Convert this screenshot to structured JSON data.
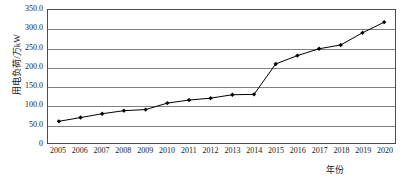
{
  "chart_data": {
    "type": "line",
    "title": "",
    "xlabel": "年份",
    "ylabel": "用电负荷/万kW",
    "categories": [
      "2005",
      "2006",
      "2007",
      "2008",
      "2009",
      "2010",
      "2011",
      "2012",
      "2013",
      "2014",
      "2015",
      "2016",
      "2017",
      "2018",
      "2019",
      "2020"
    ],
    "values": [
      57,
      67,
      77,
      85,
      88,
      105,
      113,
      118,
      127,
      128,
      208,
      230,
      248,
      258,
      290,
      318
    ],
    "series": [
      {
        "name": "用电负荷",
        "values": [
          57,
          67,
          77,
          85,
          88,
          105,
          113,
          118,
          127,
          128,
          208,
          230,
          248,
          258,
          290,
          318
        ]
      }
    ],
    "ylim": [
      0,
      350
    ],
    "ytick_labels": [
      "0",
      "50.0",
      "100.0",
      "150.0",
      "200.0",
      "250.0",
      "300.0",
      "350.0"
    ],
    "ytick_values": [
      0,
      50,
      100,
      150,
      200,
      250,
      300,
      350
    ],
    "grid": true,
    "grid_axis": "y",
    "legend": "none",
    "marker": "diamond",
    "line_color": "#000000",
    "marker_color": "#000000",
    "grid_color": "#808080",
    "border_color": "#4d4d4d"
  }
}
